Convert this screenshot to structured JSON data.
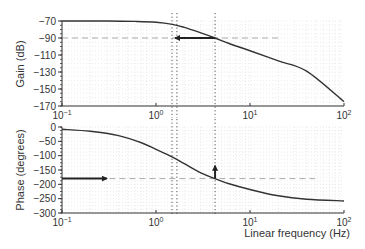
{
  "chart_data": [
    {
      "type": "line",
      "panel": "gain",
      "title": "",
      "xlabel": "",
      "ylabel": "Gain (dB)",
      "xscale": "log",
      "xlim": [
        0.1,
        100
      ],
      "ylim": [
        -170,
        -70
      ],
      "yticks": [
        -70,
        -90,
        -110,
        -130,
        -150,
        -170
      ],
      "ytick_labels": [
        "−70",
        "−90",
        "−110",
        "−130",
        "−150",
        "−170"
      ],
      "xticks": [
        0.1,
        1,
        10,
        100
      ],
      "xtick_labels": [
        {
          "base": "10",
          "exp": "−1"
        },
        {
          "base": "10",
          "exp": "0"
        },
        {
          "base": "10",
          "exp": "1"
        },
        {
          "base": "10",
          "exp": "2"
        }
      ],
      "grid": true,
      "series": [
        {
          "name": "gain",
          "x": [
            0.1,
            0.3,
            0.6,
            1.0,
            1.5,
            2.0,
            3.0,
            4.25,
            6.0,
            10,
            20,
            40,
            100
          ],
          "y": [
            -70,
            -70,
            -70.5,
            -71.5,
            -74,
            -77.5,
            -84,
            -90,
            -96.5,
            -105,
            -117,
            -129,
            -165
          ]
        }
      ],
      "reference_line": {
        "y": -90,
        "x_from": 0.1,
        "x_to": 21.7,
        "style": "dashed"
      },
      "arrow": {
        "from": [
          4.25,
          -90
        ],
        "to": [
          1.6,
          -90
        ],
        "direction": "left"
      }
    },
    {
      "type": "line",
      "panel": "phase",
      "title": "",
      "xlabel": "Linear frequency (Hz)",
      "ylabel": "Phase (degrees)",
      "xscale": "log",
      "xlim": [
        0.1,
        100
      ],
      "ylim": [
        -300,
        0
      ],
      "yticks": [
        0,
        -50,
        -100,
        -150,
        -200,
        -250,
        -300
      ],
      "ytick_labels": [
        "0",
        "−50",
        "−100",
        "−150",
        "−200",
        "−250",
        "−300"
      ],
      "xticks": [
        0.1,
        1,
        10,
        100
      ],
      "xtick_labels": [
        {
          "base": "10",
          "exp": "−1"
        },
        {
          "base": "10",
          "exp": "0"
        },
        {
          "base": "10",
          "exp": "1"
        },
        {
          "base": "10",
          "exp": "2"
        }
      ],
      "grid": true,
      "series": [
        {
          "name": "phase",
          "x": [
            0.1,
            0.2,
            0.4,
            0.7,
            1.0,
            1.5,
            2.0,
            3.0,
            4.25,
            6.0,
            10,
            20,
            40,
            100
          ],
          "y": [
            -8,
            -15,
            -30,
            -55,
            -78,
            -105,
            -128,
            -160,
            -180,
            -198,
            -218,
            -240,
            -252,
            -258
          ]
        }
      ],
      "reference_line": {
        "y": -180,
        "x_from": 0.25,
        "x_to": 49,
        "style": "dashed"
      },
      "arrow_left": {
        "from": [
          0.1,
          -180
        ],
        "to": [
          0.3,
          -180
        ],
        "direction": "right"
      },
      "arrow_up": {
        "from": [
          4.25,
          -180
        ],
        "to": [
          4.25,
          -135
        ],
        "direction": "up"
      }
    }
  ],
  "vertical_markers": [
    1.48,
    1.67,
    4.25
  ],
  "colors": {
    "curve": "#333333",
    "axis": "#333333",
    "grid": "#dddddd",
    "dashed": "#aaaaaa",
    "marker": "#555555",
    "arrow": "#222222"
  }
}
